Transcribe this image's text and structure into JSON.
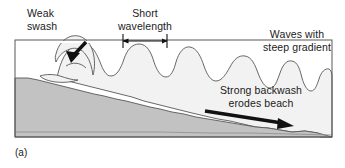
{
  "figure": {
    "caption": "(a)",
    "type": "destructive-wave-beach-profile-diagram"
  },
  "labels": {
    "weak_swash": "Weak\nswash",
    "short_wavelength": "Short\nwavelength",
    "waves_steep_gradient": "Waves with\nsteep gradient",
    "strong_backwash": "Strong backwash\nerodes beach"
  },
  "annotations": {
    "swash_arrow": "swash-arrow-down-left",
    "wavelength_arrow": "double-headed-measure-arrow",
    "backwash_arrow": "backwash-arrow-down-right"
  },
  "colors": {
    "beach_fill": "#c2c2c2",
    "water_fill": "#f2f2f2",
    "outline": "#4d4d4d",
    "arrow": "#111111",
    "text": "#1a1a1a",
    "background": "#ffffff"
  },
  "geometry": {
    "frame": {
      "x": 15,
      "y": 40,
      "width": 317,
      "height": 97
    },
    "sea_level_left": 78,
    "sea_level_right": 100,
    "wave_crest_count": 7
  }
}
